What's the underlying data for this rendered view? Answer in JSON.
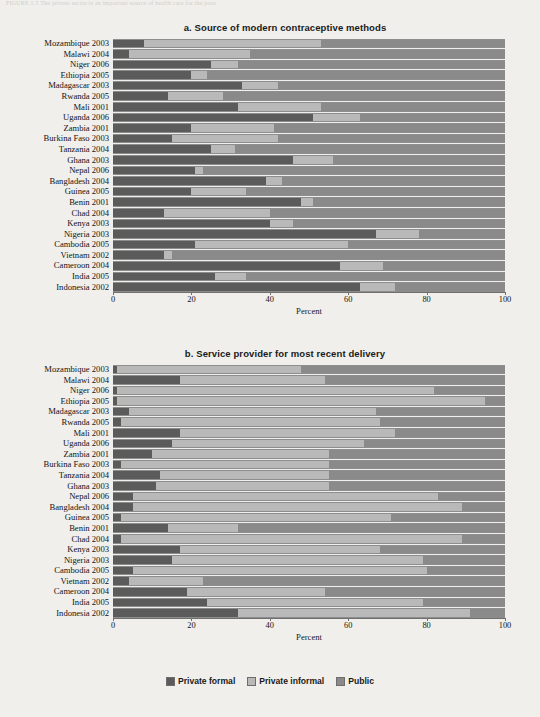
{
  "figure_caption": "FIGURE 1.5   The private sector is an important source of health care for the poor",
  "legend": {
    "items": [
      {
        "label": "Private formal",
        "key": "formal",
        "color": "#5b5b5b"
      },
      {
        "label": "Private informal",
        "key": "informal",
        "color": "#b9b9b9"
      },
      {
        "label": "Public",
        "key": "public",
        "color": "#8a8a8a"
      }
    ]
  },
  "axis": {
    "title": "Percent",
    "ticks": [
      0,
      20,
      40,
      60,
      80,
      100
    ],
    "min": 0,
    "max": 100
  },
  "chart_data": [
    {
      "type": "bar",
      "orientation": "horizontal",
      "stacked": true,
      "title": "a. Source of modern contraceptive methods",
      "xlabel": "Percent",
      "ylabel": "",
      "xlim": [
        0,
        100
      ],
      "grid": false,
      "legend_position": "bottom",
      "series": [
        {
          "name": "Private formal",
          "key": "formal",
          "color": "#5b5b5b"
        },
        {
          "name": "Private informal",
          "key": "informal",
          "color": "#b9b9b9"
        },
        {
          "name": "Public",
          "key": "public",
          "color": "#8a8a8a"
        }
      ],
      "categories": [
        "Mozambique 2003",
        "Malawi 2004",
        "Niger 2006",
        "Ethiopia 2005",
        "Madagascar 2003",
        "Rwanda 2005",
        "Mali 2001",
        "Uganda 2006",
        "Zambia 2001",
        "Burkina Faso 2003",
        "Tanzania 2004",
        "Ghana 2003",
        "Nepal 2006",
        "Bangladesh 2004",
        "Guinea 2005",
        "Benin 2001",
        "Chad 2004",
        "Kenya 2003",
        "Nigeria 2003",
        "Cambodia 2005",
        "Vietnam 2002",
        "Cameroon 2004",
        "India 2005",
        "Indonesia 2002"
      ],
      "rows": [
        {
          "category": "Mozambique 2003",
          "formal": 8,
          "informal": 45,
          "public": 47
        },
        {
          "category": "Malawi 2004",
          "formal": 4,
          "informal": 31,
          "public": 65
        },
        {
          "category": "Niger 2006",
          "formal": 25,
          "informal": 7,
          "public": 68
        },
        {
          "category": "Ethiopia 2005",
          "formal": 20,
          "informal": 4,
          "public": 76
        },
        {
          "category": "Madagascar 2003",
          "formal": 33,
          "informal": 9,
          "public": 58
        },
        {
          "category": "Rwanda 2005",
          "formal": 14,
          "informal": 14,
          "public": 72
        },
        {
          "category": "Mali 2001",
          "formal": 32,
          "informal": 21,
          "public": 47
        },
        {
          "category": "Uganda 2006",
          "formal": 51,
          "informal": 12,
          "public": 37
        },
        {
          "category": "Zambia 2001",
          "formal": 20,
          "informal": 21,
          "public": 59
        },
        {
          "category": "Burkina Faso 2003",
          "formal": 15,
          "informal": 27,
          "public": 58
        },
        {
          "category": "Tanzania 2004",
          "formal": 25,
          "informal": 6,
          "public": 69
        },
        {
          "category": "Ghana 2003",
          "formal": 46,
          "informal": 10,
          "public": 44
        },
        {
          "category": "Nepal 2006",
          "formal": 21,
          "informal": 2,
          "public": 77
        },
        {
          "category": "Bangladesh 2004",
          "formal": 39,
          "informal": 4,
          "public": 57
        },
        {
          "category": "Guinea 2005",
          "formal": 20,
          "informal": 14,
          "public": 66
        },
        {
          "category": "Benin 2001",
          "formal": 48,
          "informal": 3,
          "public": 49
        },
        {
          "category": "Chad 2004",
          "formal": 13,
          "informal": 27,
          "public": 60
        },
        {
          "category": "Kenya 2003",
          "formal": 40,
          "informal": 6,
          "public": 54
        },
        {
          "category": "Nigeria 2003",
          "formal": 67,
          "informal": 11,
          "public": 22
        },
        {
          "category": "Cambodia 2005",
          "formal": 21,
          "informal": 39,
          "public": 40
        },
        {
          "category": "Vietnam 2002",
          "formal": 13,
          "informal": 2,
          "public": 85
        },
        {
          "category": "Cameroon 2004",
          "formal": 58,
          "informal": 11,
          "public": 31
        },
        {
          "category": "India 2005",
          "formal": 26,
          "informal": 8,
          "public": 66
        },
        {
          "category": "Indonesia 2002",
          "formal": 63,
          "informal": 9,
          "public": 28
        }
      ]
    },
    {
      "type": "bar",
      "orientation": "horizontal",
      "stacked": true,
      "title": "b. Service provider for most recent delivery",
      "xlabel": "Percent",
      "ylabel": "",
      "xlim": [
        0,
        100
      ],
      "grid": false,
      "legend_position": "bottom",
      "series": [
        {
          "name": "Private formal",
          "key": "formal",
          "color": "#5b5b5b"
        },
        {
          "name": "Private informal",
          "key": "informal",
          "color": "#b9b9b9"
        },
        {
          "name": "Public",
          "key": "public",
          "color": "#8a8a8a"
        }
      ],
      "categories": [
        "Mozambique 2003",
        "Malawi 2004",
        "Niger 2006",
        "Ethiopia 2005",
        "Madagascar 2003",
        "Rwanda 2005",
        "Mali 2001",
        "Uganda 2006",
        "Zambia 2001",
        "Burkina Faso 2003",
        "Tanzania 2004",
        "Ghana 2003",
        "Nepal 2006",
        "Bangladesh 2004",
        "Guinea 2005",
        "Benin 2001",
        "Chad 2004",
        "Kenya 2003",
        "Nigeria 2003",
        "Cambodia 2005",
        "Vietnam 2002",
        "Cameroon 2004",
        "India 2005",
        "Indonesia 2002"
      ],
      "rows": [
        {
          "category": "Mozambique 2003",
          "formal": 1,
          "informal": 47,
          "public": 52
        },
        {
          "category": "Malawi 2004",
          "formal": 17,
          "informal": 37,
          "public": 46
        },
        {
          "category": "Niger 2006",
          "formal": 1,
          "informal": 81,
          "public": 18
        },
        {
          "category": "Ethiopia 2005",
          "formal": 1,
          "informal": 94,
          "public": 5
        },
        {
          "category": "Madagascar 2003",
          "formal": 4,
          "informal": 63,
          "public": 33
        },
        {
          "category": "Rwanda 2005",
          "formal": 2,
          "informal": 66,
          "public": 32
        },
        {
          "category": "Mali 2001",
          "formal": 17,
          "informal": 55,
          "public": 28
        },
        {
          "category": "Uganda 2006",
          "formal": 15,
          "informal": 49,
          "public": 36
        },
        {
          "category": "Zambia 2001",
          "formal": 10,
          "informal": 45,
          "public": 45
        },
        {
          "category": "Burkina Faso 2003",
          "formal": 2,
          "informal": 53,
          "public": 45
        },
        {
          "category": "Tanzania 2004",
          "formal": 12,
          "informal": 43,
          "public": 45
        },
        {
          "category": "Ghana 2003",
          "formal": 11,
          "informal": 44,
          "public": 45
        },
        {
          "category": "Nepal 2006",
          "formal": 5,
          "informal": 78,
          "public": 17
        },
        {
          "category": "Bangladesh 2004",
          "formal": 5,
          "informal": 84,
          "public": 11
        },
        {
          "category": "Guinea 2005",
          "formal": 2,
          "informal": 69,
          "public": 29
        },
        {
          "category": "Benin 2001",
          "formal": 14,
          "informal": 18,
          "public": 68
        },
        {
          "category": "Chad 2004",
          "formal": 2,
          "informal": 87,
          "public": 11
        },
        {
          "category": "Kenya 2003",
          "formal": 17,
          "informal": 51,
          "public": 32
        },
        {
          "category": "Nigeria 2003",
          "formal": 15,
          "informal": 64,
          "public": 21
        },
        {
          "category": "Cambodia 2005",
          "formal": 5,
          "informal": 75,
          "public": 20
        },
        {
          "category": "Vietnam 2002",
          "formal": 4,
          "informal": 19,
          "public": 77
        },
        {
          "category": "Cameroon 2004",
          "formal": 19,
          "informal": 35,
          "public": 46
        },
        {
          "category": "India 2005",
          "formal": 24,
          "informal": 55,
          "public": 21
        },
        {
          "category": "Indonesia 2002",
          "formal": 32,
          "informal": 59,
          "public": 9
        }
      ]
    }
  ]
}
